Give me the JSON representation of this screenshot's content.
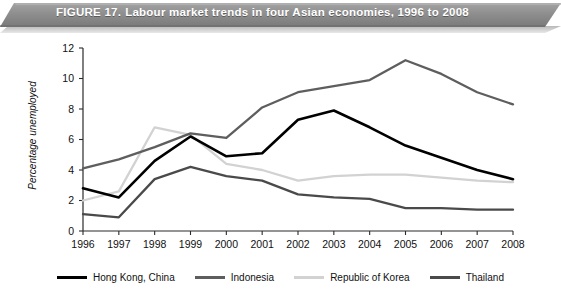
{
  "banner": {
    "figure_label": "FIGURE 17.",
    "title": "Labour market trends in four Asian economies, 1996 to 2008",
    "background_color": "#8c8c8c",
    "text_color": "#ffffff"
  },
  "axis": {
    "ylabel": "Percentage  unemployed",
    "y_ticks": [
      "0",
      "2",
      "4",
      "6",
      "8",
      "10",
      "12"
    ],
    "x_ticks": [
      "1996",
      "1997",
      "1998",
      "1999",
      "2000",
      "2001",
      "2002",
      "2003",
      "2004",
      "2005",
      "2006",
      "2007",
      "2008"
    ]
  },
  "legend": {
    "position": "bottom",
    "items": [
      {
        "label": "Hong Kong, China",
        "color": "#000000"
      },
      {
        "label": "Indonesia",
        "color": "#5e5e5e"
      },
      {
        "label": "Republic of Korea",
        "color": "#d2d2d2"
      },
      {
        "label": "Thailand",
        "color": "#4a4a4a"
      }
    ]
  },
  "chart_data": {
    "type": "line",
    "title": "Labour market trends in four Asian economies, 1996 to 2008",
    "xlabel": "",
    "ylabel": "Percentage  unemployed",
    "x": [
      "1996",
      "1997",
      "1998",
      "1999",
      "2000",
      "2001",
      "2002",
      "2003",
      "2004",
      "2005",
      "2006",
      "2007",
      "2008"
    ],
    "xlim": [
      "1996",
      "2008"
    ],
    "ylim": [
      0,
      12
    ],
    "y_ticks": [
      0,
      2,
      4,
      6,
      8,
      10,
      12
    ],
    "grid": false,
    "legend_position": "bottom",
    "series": [
      {
        "name": "Hong Kong, China",
        "color": "#000000",
        "values": [
          2.8,
          2.2,
          4.6,
          6.2,
          4.9,
          5.1,
          7.3,
          7.9,
          6.8,
          5.6,
          4.8,
          4.0,
          3.4
        ]
      },
      {
        "name": "Indonesia",
        "color": "#5e5e5e",
        "values": [
          4.1,
          4.7,
          5.5,
          6.4,
          6.1,
          8.1,
          9.1,
          9.5,
          9.9,
          11.2,
          10.3,
          9.1,
          8.3
        ]
      },
      {
        "name": "Republic of Korea",
        "color": "#d2d2d2",
        "values": [
          2.0,
          2.6,
          6.8,
          6.3,
          4.4,
          4.0,
          3.3,
          3.6,
          3.7,
          3.7,
          3.5,
          3.3,
          3.2
        ]
      },
      {
        "name": "Thailand",
        "color": "#4a4a4a",
        "values": [
          1.1,
          0.9,
          3.4,
          4.2,
          3.6,
          3.3,
          2.4,
          2.2,
          2.1,
          1.5,
          1.5,
          1.4,
          1.4
        ]
      }
    ]
  }
}
